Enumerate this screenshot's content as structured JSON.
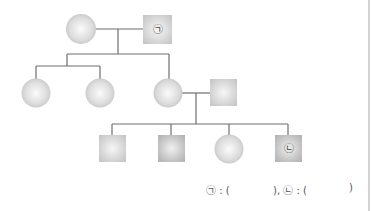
{
  "diagram": {
    "type": "pedigree-chart",
    "colors": {
      "line": "#6e6e6e",
      "shape_light": "#f2f2f2",
      "shape_mid": "#cfcfcf",
      "shape_dark": "#bdbdbd"
    },
    "generations": [
      {
        "level": 1,
        "members": [
          {
            "id": "g1-female",
            "sex": "female",
            "shape": "circle",
            "label": ""
          },
          {
            "id": "g1-male",
            "sex": "male",
            "shape": "square",
            "label": "㉠"
          }
        ]
      },
      {
        "level": 2,
        "members": [
          {
            "id": "g2-female-1",
            "sex": "female",
            "shape": "circle",
            "label": ""
          },
          {
            "id": "g2-female-2",
            "sex": "female",
            "shape": "circle",
            "label": ""
          },
          {
            "id": "g2-female-3",
            "sex": "female",
            "shape": "circle",
            "label": ""
          },
          {
            "id": "g2-male-spouse",
            "sex": "male",
            "shape": "square",
            "label": ""
          }
        ]
      },
      {
        "level": 3,
        "members": [
          {
            "id": "g3-male-1",
            "sex": "male",
            "shape": "square",
            "label": ""
          },
          {
            "id": "g3-male-2",
            "sex": "male",
            "shape": "square",
            "label": ""
          },
          {
            "id": "g3-female-1",
            "sex": "female",
            "shape": "circle",
            "label": ""
          },
          {
            "id": "g3-male-3",
            "sex": "male",
            "shape": "square",
            "label": "㉡"
          }
        ]
      }
    ],
    "labels": {
      "g1_male": "㉠",
      "g3_male_3": "㉡"
    }
  },
  "answer_line": {
    "part1": "㉠ : (",
    "part2": "), ㉡ : (",
    "part3": ")"
  }
}
